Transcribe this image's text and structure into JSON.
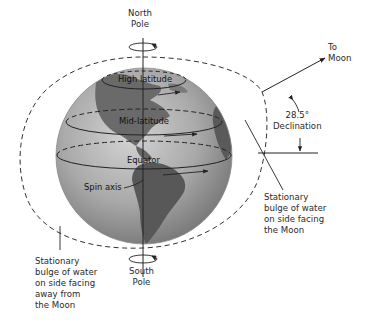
{
  "diagram": {
    "labels": {
      "north_pole": "North\nPole",
      "south_pole": "South\nPole",
      "high_latitude": "High latitude",
      "mid_latitude": "Mid-latitude",
      "equator": "Equator",
      "spin_axis": "Spin axis",
      "to_moon": "To\nMoon",
      "declination": "28.5°\nDeclination",
      "bulge_near": "Stationary\nbulge of water\non side facing\nthe Moon",
      "bulge_far": "Stationary\nbulge of water\non side facing\naway from\nthe Moon"
    },
    "declination_deg": "28.5°",
    "colors": {
      "globe_ocean_light": "#b8b8b8",
      "globe_ocean_dark": "#7a7a7a",
      "land": "#5e5e5e",
      "lines": "#222222",
      "text": "#2a2a2a",
      "background": "#ffffff"
    },
    "icons": {
      "rotation_arrow_north": "rotation-arrow-icon",
      "rotation_arrow_south": "rotation-arrow-icon",
      "moon_direction_arrow": "arrow-icon"
    }
  }
}
